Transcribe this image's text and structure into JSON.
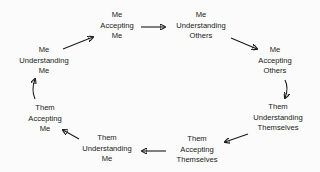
{
  "diagram": {
    "type": "cycle",
    "nodes": [
      {
        "id": "me-accepting-me",
        "lines": [
          "Me",
          "Accepting",
          "Me"
        ]
      },
      {
        "id": "me-understanding-others",
        "lines": [
          "Me",
          "Understanding",
          "Others"
        ]
      },
      {
        "id": "me-accepting-others",
        "lines": [
          "Me",
          "Accepting",
          "Others"
        ]
      },
      {
        "id": "them-understanding-themselves",
        "lines": [
          "Them",
          "Understanding",
          "Themselves"
        ]
      },
      {
        "id": "them-accepting-themselves",
        "lines": [
          "Them",
          "Accepting",
          "Themselves"
        ]
      },
      {
        "id": "them-understanding-me",
        "lines": [
          "Them",
          "Understanding",
          "Me"
        ]
      },
      {
        "id": "them-accepting-me",
        "lines": [
          "Them",
          "Accepting",
          "Me"
        ]
      },
      {
        "id": "me-understanding-me",
        "lines": [
          "Me",
          "Understanding",
          "Me"
        ]
      }
    ],
    "edges": [
      {
        "from": "me-understanding-me",
        "to": "me-accepting-me"
      },
      {
        "from": "me-accepting-me",
        "to": "me-understanding-others"
      },
      {
        "from": "me-understanding-others",
        "to": "me-accepting-others"
      },
      {
        "from": "me-accepting-others",
        "to": "them-understanding-themselves"
      },
      {
        "from": "them-understanding-themselves",
        "to": "them-accepting-themselves"
      },
      {
        "from": "them-accepting-themselves",
        "to": "them-understanding-me"
      },
      {
        "from": "them-understanding-me",
        "to": "them-accepting-me"
      },
      {
        "from": "them-accepting-me",
        "to": "me-understanding-me"
      }
    ]
  }
}
